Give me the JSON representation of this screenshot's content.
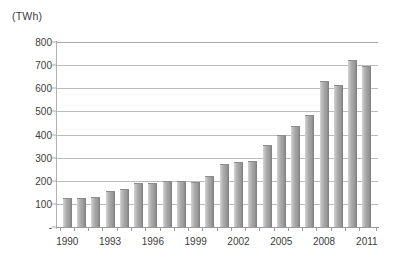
{
  "chart_data": {
    "type": "bar",
    "title": "",
    "subtitle": "",
    "unit_label": "(TWh)",
    "xlabel": "",
    "ylabel": "",
    "ylim": [
      0,
      800
    ],
    "ytick_step": 100,
    "grid": true,
    "legend": "none",
    "zero_tick_label": "-",
    "ytick_labels": [
      "800",
      "700",
      "600",
      "500",
      "400",
      "300",
      "200",
      "100",
      "-"
    ],
    "ytick_values": [
      800,
      700,
      600,
      500,
      400,
      300,
      200,
      100,
      0
    ],
    "xtick_labels": [
      "1990",
      "1993",
      "1996",
      "1999",
      "2002",
      "2005",
      "2008",
      "2011"
    ],
    "categories": [
      "1990",
      "1991",
      "1992",
      "1993",
      "1994",
      "1995",
      "1996",
      "1997",
      "1998",
      "1999",
      "2000",
      "2001",
      "2002",
      "2003",
      "2004",
      "2005",
      "2006",
      "2007",
      "2008",
      "2009",
      "2010",
      "2011"
    ],
    "values": [
      120,
      122,
      125,
      150,
      160,
      188,
      186,
      196,
      196,
      192,
      215,
      270,
      278,
      280,
      350,
      392,
      432,
      480,
      628,
      610,
      720,
      692
    ],
    "bar_color": "#a4a4a4",
    "grid_color": "#bcbcbc",
    "axis_color": "#9a9a9a",
    "text_color": "#3c3c3c",
    "background": "#ffffff"
  }
}
